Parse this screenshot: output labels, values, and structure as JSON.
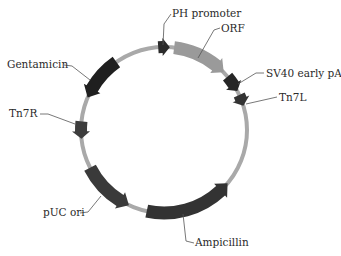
{
  "diagram": {
    "type": "plasmid-map",
    "center": [
      164,
      130
    ],
    "radius": 83,
    "backbone_color": "#a9a9a9",
    "colors": {
      "dark": "#2b2b2b",
      "medium": "#3d3d3d",
      "orf": "#9a9a9a",
      "label_line": "#555555",
      "text": "#2a2a2a"
    },
    "features": [
      {
        "name": "PH promoter",
        "start": -4,
        "end": 4,
        "direction": "cw",
        "color": "#2b2b2b",
        "kind": "marker"
      },
      {
        "name": "ORF",
        "start": 7,
        "end": 46,
        "direction": "cw",
        "color": "#9a9a9a",
        "kind": "gene"
      },
      {
        "name": "SV40 early pA",
        "start": 50,
        "end": 62,
        "direction": "cw",
        "color": "#262626",
        "kind": "marker"
      },
      {
        "name": "Tn7L",
        "start": 65,
        "end": 73,
        "direction": "cw",
        "color": "#333333",
        "kind": "marker"
      },
      {
        "name": "Ampicillin",
        "start": 130,
        "end": 192,
        "direction": "ccw",
        "color": "#333333",
        "kind": "gene"
      },
      {
        "name": "pUC ori",
        "start": 205,
        "end": 243,
        "direction": "ccw",
        "color": "#3a3a3a",
        "kind": "gene"
      },
      {
        "name": "Tn7R",
        "start": 264,
        "end": 276,
        "direction": "ccw",
        "color": "#3d3d3d",
        "kind": "marker"
      },
      {
        "name": "Gentamicin",
        "start": 293,
        "end": 325,
        "direction": "ccw",
        "color": "#1f1f1f",
        "kind": "gene"
      }
    ],
    "labels": [
      {
        "text": "PH promoter",
        "x": 172,
        "y": 17,
        "anchor": "start",
        "line": [
          [
            171,
            14
          ],
          [
            164,
            24
          ],
          [
            163,
            45
          ]
        ]
      },
      {
        "text": "ORF",
        "x": 221,
        "y": 32,
        "anchor": "start",
        "line": [
          [
            220,
            28
          ],
          [
            214,
            30
          ],
          [
            198,
            58
          ]
        ]
      },
      {
        "text": "SV40 early pA",
        "x": 266,
        "y": 77,
        "anchor": "start",
        "line": [
          [
            264,
            73
          ],
          [
            256,
            73
          ],
          [
            238,
            84
          ]
        ]
      },
      {
        "text": "Tn7L",
        "x": 279,
        "y": 101,
        "anchor": "start",
        "line": [
          [
            277,
            97
          ],
          [
            246,
            104
          ]
        ]
      },
      {
        "text": "Ampicillin",
        "x": 195,
        "y": 246,
        "anchor": "start",
        "line": [
          [
            194,
            243
          ],
          [
            186,
            241
          ],
          [
            183,
            214
          ]
        ]
      },
      {
        "text": "pUC ori",
        "x": 43,
        "y": 216,
        "anchor": "start",
        "line": [
          [
            80,
            213
          ],
          [
            88,
            212
          ],
          [
            101,
            196
          ]
        ]
      },
      {
        "text": "Tn7R",
        "x": 9,
        "y": 117,
        "anchor": "start",
        "line": [
          [
            40,
            114
          ],
          [
            48,
            114
          ],
          [
            75,
            124
          ]
        ]
      },
      {
        "text": "Gentamicin",
        "x": 7,
        "y": 68,
        "anchor": "start",
        "line": [
          [
            64,
            65
          ],
          [
            72,
            66
          ],
          [
            90,
            80
          ]
        ]
      }
    ]
  }
}
